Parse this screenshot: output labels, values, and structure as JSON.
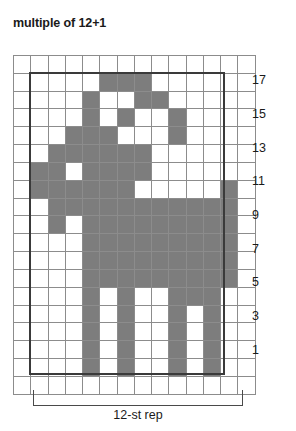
{
  "title": "multiple of 12+1",
  "colors": {
    "filled": "#7d7d7d",
    "empty": "#ffffff",
    "grid_line": "#8c8c8c",
    "repeat_outline": "#3a3a3a",
    "text": "#1a1a1a"
  },
  "grid": {
    "columns": 14,
    "rows": 19,
    "repeat_columns": 12,
    "repeat_start_column": 2,
    "repeat_end_column": 13
  },
  "row_labels": [
    "17",
    "15",
    "13",
    "11",
    "9",
    "7",
    "5",
    "3",
    "1"
  ],
  "repeat": {
    "caption": "12-st rep"
  },
  "chart_data": {
    "type": "heatmap",
    "title": "multiple of 12+1",
    "xlabel": "",
    "ylabel": "",
    "legend": [
      {
        "swatch": "#7d7d7d",
        "label": "main color stitch"
      },
      {
        "swatch": "#ffffff",
        "label": "background stitch"
      }
    ],
    "columns": 14,
    "rows": 19,
    "row_numbers_shown": [
      "17",
      "15",
      "13",
      "11",
      "9",
      "7",
      "5",
      "3",
      "1"
    ],
    "cells_note": "1 = filled gray stitch, 0 = empty stitch. Rows listed top (row 19 blank margin) to bottom (row 1).",
    "matrix": [
      [
        0,
        0,
        0,
        0,
        0,
        0,
        0,
        0,
        0,
        0,
        0,
        0,
        0,
        0
      ],
      [
        0,
        0,
        0,
        0,
        0,
        1,
        1,
        1,
        0,
        0,
        0,
        0,
        0,
        0
      ],
      [
        0,
        0,
        0,
        0,
        1,
        0,
        0,
        1,
        1,
        0,
        0,
        0,
        0,
        0
      ],
      [
        0,
        0,
        0,
        0,
        1,
        0,
        1,
        0,
        0,
        1,
        0,
        0,
        0,
        0
      ],
      [
        0,
        0,
        0,
        1,
        1,
        1,
        0,
        0,
        0,
        1,
        0,
        0,
        0,
        0
      ],
      [
        0,
        0,
        1,
        1,
        1,
        1,
        1,
        1,
        0,
        0,
        0,
        0,
        0,
        0
      ],
      [
        0,
        1,
        1,
        0,
        1,
        1,
        1,
        1,
        0,
        0,
        0,
        0,
        0,
        0
      ],
      [
        0,
        1,
        1,
        1,
        1,
        1,
        1,
        0,
        0,
        0,
        0,
        0,
        1,
        0
      ],
      [
        0,
        0,
        1,
        1,
        1,
        1,
        1,
        1,
        1,
        1,
        1,
        1,
        1,
        0
      ],
      [
        0,
        0,
        1,
        0,
        1,
        1,
        1,
        1,
        1,
        1,
        1,
        1,
        1,
        0
      ],
      [
        0,
        0,
        0,
        0,
        1,
        1,
        1,
        1,
        1,
        1,
        1,
        1,
        1,
        0
      ],
      [
        0,
        0,
        0,
        0,
        1,
        1,
        1,
        1,
        1,
        1,
        1,
        1,
        1,
        0
      ],
      [
        0,
        0,
        0,
        0,
        1,
        1,
        1,
        1,
        1,
        1,
        1,
        1,
        1,
        0
      ],
      [
        0,
        0,
        0,
        0,
        1,
        0,
        1,
        0,
        0,
        1,
        1,
        1,
        0,
        0
      ],
      [
        0,
        0,
        0,
        0,
        1,
        0,
        1,
        0,
        0,
        1,
        0,
        1,
        0,
        0
      ],
      [
        0,
        0,
        0,
        0,
        1,
        0,
        1,
        0,
        0,
        1,
        0,
        1,
        0,
        0
      ],
      [
        0,
        0,
        0,
        0,
        1,
        0,
        1,
        0,
        0,
        1,
        0,
        1,
        0,
        0
      ],
      [
        0,
        0,
        0,
        0,
        1,
        0,
        1,
        0,
        0,
        1,
        0,
        1,
        0,
        0
      ],
      [
        0,
        0,
        0,
        0,
        0,
        0,
        0,
        0,
        0,
        0,
        0,
        0,
        0,
        0
      ]
    ]
  }
}
